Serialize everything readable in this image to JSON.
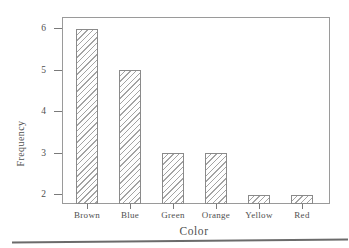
{
  "chart_data": {
    "type": "bar",
    "categories": [
      "Brown",
      "Blue",
      "Green",
      "Orange",
      "Yellow",
      "Red"
    ],
    "values": [
      6,
      5,
      3,
      3,
      2,
      2
    ],
    "title": "",
    "xlabel": "Color",
    "ylabel": "Frequency",
    "yticks": [
      2,
      3,
      4,
      5,
      6
    ],
    "ylim": [
      1.78,
      6.28
    ],
    "grid": false,
    "legend": null,
    "bar_style": {
      "fill": "#fefefe",
      "hatch": "diagonal-forward",
      "hatch_color": "#a3a3a3",
      "border_color": "#8a8a8a"
    },
    "colors": {
      "axis_box": "#9a9a9a",
      "tick": "#7a7a7a",
      "text": "#4f4f4f",
      "separator": "#6b6b6b",
      "background": "#ffffff"
    }
  }
}
